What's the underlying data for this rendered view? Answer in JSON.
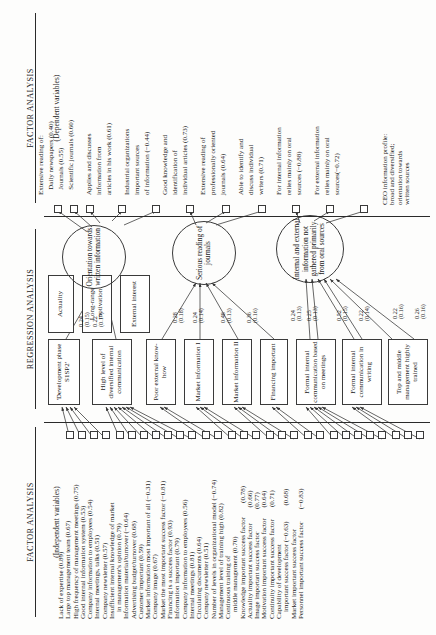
{
  "figure": {
    "orientation": "rotated-90-ccw",
    "headers": {
      "left": {
        "title": "FACTOR ANALYSIS",
        "subtitle": "(Independent variables)"
      },
      "center": {
        "title": "REGRESSION ANALYSIS",
        "subtitle": ""
      },
      "right": {
        "title": "FACTOR ANALYSIS",
        "subtitle": "(Dependent variables)"
      }
    },
    "caption": {
      "lines": [
        "CEO information profile:",
        "broad and diversified;",
        "orientation towards",
        "written sources"
      ]
    }
  },
  "independent_factor_items": [
    {
      "label": "Lack of expertise (0.89)"
    },
    {
      "label": "Large top management team (0.67)"
    },
    {
      "label": "High frequency of management meetings (0.75)"
    },
    {
      "label": "Good internal information system (0.53)"
    },
    {
      "label": "Company information to employees (0.54)"
    },
    {
      "label": "Internal meetings, talks (0.51)"
    },
    {
      "label": "Company newsletter (0.57)"
    },
    {
      "label": "Insufficient internal knowledge of market"
    },
    {
      "label": "    in management's opinion (0.79)"
    },
    {
      "label": "Information material/turnover (−0.64)"
    },
    {
      "label": "Advertising budget/turnover (0.68)"
    },
    {
      "label": "Customer important (0.59)"
    },
    {
      "label": "Market information most important of all (−0.31)"
    },
    {
      "label": "Company image (0.67)"
    },
    {
      "label": "Market the most important success factor (−0.81)"
    },
    {
      "label": "Financing is a success factor (0.93)"
    },
    {
      "label": "Information important (0.79)"
    },
    {
      "label": "Company information to employees (0.56)"
    },
    {
      "label": "Internal meetings (0.81)"
    },
    {
      "label": "Circulating documents (0.64)"
    },
    {
      "label": "Company newsletter (0.51)"
    },
    {
      "label": "Number of levels in organizational model (−0.74)"
    },
    {
      "label": "Management level of training high (0.82)"
    },
    {
      "label": "Continuous training of"
    },
    {
      "label": "    middle management (0.70)"
    },
    {
      "label": "Knowledge important success factor        (0.78)"
    },
    {
      "label": "Actuality important success factor         (0.66)"
    },
    {
      "label": "Image important success factor             (0.77)"
    },
    {
      "label": "Motivation important success factor      (0.64)"
    },
    {
      "label": "Continuity important success factor       (0.71)"
    },
    {
      "label": "Capability of development"
    },
    {
      "label": "    important success factor (−0.63)         (0.68)"
    },
    {
      "label": "Market important success factor"
    },
    {
      "label": "Personnel important success factor       (−0.83)"
    }
  ],
  "regression_boxes": [
    {
      "id": "b1",
      "label": "'Development\nphase S1SP2'"
    },
    {
      "id": "b2",
      "label": "High level of\ndiversified internal\ncommunication"
    },
    {
      "id": "b3",
      "label": "Poor external\nknow-how"
    },
    {
      "id": "b4",
      "label": "Market\ninformation  I"
    },
    {
      "id": "b5",
      "label": "Market\ninformation  II"
    },
    {
      "id": "b6",
      "label": "Financing\nimportant"
    },
    {
      "id": "b7",
      "label": "Formal internal\ncommunication\nbased on meetings"
    },
    {
      "id": "b8",
      "label": "Formal internal\ncommunication\nin writing"
    },
    {
      "id": "b9",
      "label": "Top and middle\nmanagement\nhighly trained"
    },
    {
      "id": "b10",
      "label": "Actuality"
    },
    {
      "id": "b11",
      "label": "Long-range\nmotivation"
    },
    {
      "id": "b12",
      "label": "External\ninterest"
    }
  ],
  "latent_factors": [
    {
      "id": "f1",
      "label": "Orientation\ntowards written\ninformation"
    },
    {
      "id": "f2",
      "label": "Serious reading\nof journals"
    },
    {
      "id": "f3",
      "label": "Internal and\nexternal\ninformation not\ngathered\nprimarily from\noral sources"
    }
  ],
  "dependent_factor_items": [
    {
      "label": "Extensive reading of:"
    },
    {
      "label": "   Daily newspapers (0.40)"
    },
    {
      "label": "   Journals (0.55)"
    },
    {
      "label": "   Scientific journals (0.60)"
    },
    {
      "label": "Applies and discusses"
    },
    {
      "label": "information from"
    },
    {
      "label": "articles in his work (0.61)"
    },
    {
      "label": "Industrial organizations"
    },
    {
      "label": "important sources"
    },
    {
      "label": "of information (−0.44)"
    },
    {
      "label": "Good knowledge and"
    },
    {
      "label": "identification of"
    },
    {
      "label": "individual articles (0.73)"
    },
    {
      "label": "Extensive reading of"
    },
    {
      "label": "professionally oriented"
    },
    {
      "label": "journals (0.64)"
    },
    {
      "label": "Able to identify and"
    },
    {
      "label": "discuss individual"
    },
    {
      "label": "writers (0.71)"
    },
    {
      "label": "For internal information"
    },
    {
      "label": "relies mainly on oral"
    },
    {
      "label": "sources (−0.88)"
    },
    {
      "label": "For external information"
    },
    {
      "label": "relies mainly on oral"
    },
    {
      "label": "sources(−0.72)"
    }
  ],
  "path_coefficients": [
    {
      "from": "b1",
      "to": "f1",
      "beta": "0.24",
      "se": "(0.15)"
    },
    {
      "from": "b2",
      "to": "f1",
      "beta": "0.22",
      "se": "(0.17)"
    },
    {
      "from": "b3",
      "to": "f2",
      "beta": "0.28",
      "se": "(0.18)"
    },
    {
      "from": "b4",
      "to": "f2",
      "beta": "0.24",
      "se": "(0.14)"
    },
    {
      "from": "b5",
      "to": "f2",
      "beta": "0.48",
      "se": "(0.13)"
    },
    {
      "from": "b6",
      "to": "f2",
      "beta": "0.36",
      "se": "(0.16)"
    },
    {
      "from": "b7",
      "to": "f3",
      "beta": "0.24",
      "se": "(0.13)"
    },
    {
      "from": "b8",
      "to": "f3",
      "beta": "0.25",
      "se": "(0.13)"
    },
    {
      "from": "b9",
      "to": "f3",
      "beta": "0.52",
      "se": "(0.15)"
    },
    {
      "from": "b10",
      "to": "f3",
      "beta": "0.22",
      "se": "(0.14)"
    },
    {
      "from": "b11",
      "to": "f3",
      "beta": "0.22",
      "se": "(0.16)"
    },
    {
      "from": "b12",
      "to": "f3",
      "beta": "0.26",
      "se": "(0.16)"
    }
  ]
}
